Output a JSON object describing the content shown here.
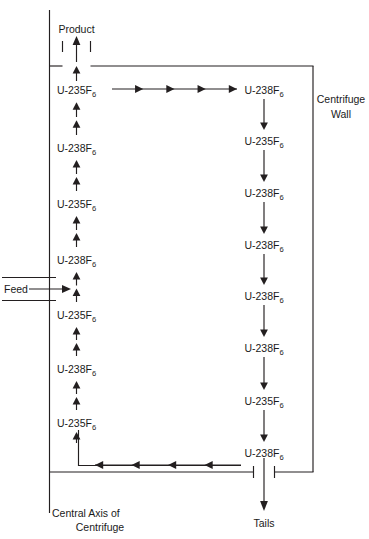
{
  "figure": {
    "ink_color": "#231f20",
    "background_color": "#ffffff"
  },
  "annotations": {
    "product": "Product",
    "feed": "Feed",
    "tails": "Tails",
    "centrifuge_wall_line1": "Centrifuge",
    "centrifuge_wall_line2": "Wall",
    "central_axis_line1": "Central Axis of",
    "central_axis_line2": "Centrifuge"
  },
  "species": {
    "u235": {
      "prefix": "U-235F",
      "subscript": "6"
    },
    "u238": {
      "prefix": "U-238F",
      "subscript": "6"
    }
  },
  "inner_column": {
    "direction": "upward",
    "arrow_count_between_labels": 2,
    "labels": [
      {
        "prefix": "U-235F",
        "subscript": "6",
        "y": 90
      },
      {
        "prefix": "U-238F",
        "subscript": "6",
        "y": 148
      },
      {
        "prefix": "U-235F",
        "subscript": "6",
        "y": 204
      },
      {
        "prefix": "U-238F",
        "subscript": "6",
        "y": 260
      },
      {
        "prefix": "U-235F",
        "subscript": "6",
        "y": 315
      },
      {
        "prefix": "U-238F",
        "subscript": "6",
        "y": 369
      },
      {
        "prefix": "U-235F",
        "subscript": "6",
        "y": 423
      }
    ]
  },
  "wall_column": {
    "direction": "downward",
    "arrow_count_between_labels": 1,
    "labels": [
      {
        "prefix": "U-238F",
        "subscript": "6",
        "y": 90
      },
      {
        "prefix": "U-235F",
        "subscript": "6",
        "y": 141
      },
      {
        "prefix": "U-238F",
        "subscript": "6",
        "y": 193
      },
      {
        "prefix": "U-238F",
        "subscript": "6",
        "y": 245
      },
      {
        "prefix": "U-238F",
        "subscript": "6",
        "y": 296
      },
      {
        "prefix": "U-238F",
        "subscript": "6",
        "y": 348
      },
      {
        "prefix": "U-235F",
        "subscript": "6",
        "y": 401
      },
      {
        "prefix": "U-238F",
        "subscript": "6",
        "y": 453
      }
    ]
  },
  "top_transfer": {
    "direction": "rightward",
    "arrowheads": 4,
    "y": 89
  },
  "bottom_transfer": {
    "direction": "leftward",
    "arrowheads": 4,
    "y": 465
  }
}
